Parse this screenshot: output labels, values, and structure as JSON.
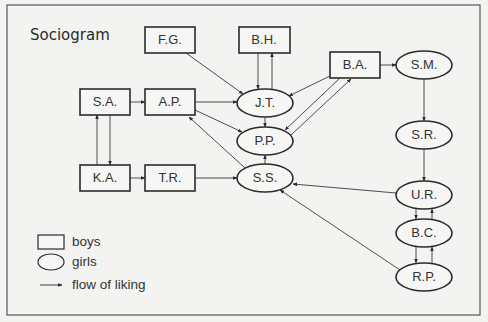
{
  "title": "Sociogram",
  "nodes": [
    {
      "id": "FG",
      "label": "F.G.",
      "type": "boy"
    },
    {
      "id": "BH",
      "label": "B.H.",
      "type": "boy"
    },
    {
      "id": "BA",
      "label": "B.A.",
      "type": "boy"
    },
    {
      "id": "SM",
      "label": "S.M.",
      "type": "girl"
    },
    {
      "id": "SA",
      "label": "S.A.",
      "type": "boy"
    },
    {
      "id": "AP",
      "label": "A.P.",
      "type": "boy"
    },
    {
      "id": "JT",
      "label": "J.T.",
      "type": "girl"
    },
    {
      "id": "PP",
      "label": "P.P.",
      "type": "girl"
    },
    {
      "id": "SR",
      "label": "S.R.",
      "type": "girl"
    },
    {
      "id": "KA",
      "label": "K.A.",
      "type": "boy"
    },
    {
      "id": "TR",
      "label": "T.R.",
      "type": "boy"
    },
    {
      "id": "SS",
      "label": "S.S.",
      "type": "girl"
    },
    {
      "id": "UR",
      "label": "U.R.",
      "type": "girl"
    },
    {
      "id": "BC",
      "label": "B.C.",
      "type": "girl"
    },
    {
      "id": "RP",
      "label": "R.P.",
      "type": "girl"
    }
  ],
  "edges": [
    [
      "FG",
      "JT"
    ],
    [
      "BH",
      "JT"
    ],
    [
      "JT",
      "BH"
    ],
    [
      "BA",
      "JT"
    ],
    [
      "BA",
      "PP"
    ],
    [
      "PP",
      "BA"
    ],
    [
      "BA",
      "SM"
    ],
    [
      "SM",
      "SR"
    ],
    [
      "SR",
      "UR"
    ],
    [
      "SA",
      "AP"
    ],
    [
      "AP",
      "JT"
    ],
    [
      "AP",
      "PP"
    ],
    [
      "SA",
      "KA"
    ],
    [
      "KA",
      "SA"
    ],
    [
      "KA",
      "TR"
    ],
    [
      "TR",
      "SS"
    ],
    [
      "SS",
      "AP"
    ],
    [
      "SS",
      "PP"
    ],
    [
      "JT",
      "PP"
    ],
    [
      "UR",
      "SS"
    ],
    [
      "RP",
      "SS"
    ],
    [
      "UR",
      "BC"
    ],
    [
      "BC",
      "UR"
    ],
    [
      "BC",
      "RP"
    ],
    [
      "RP",
      "BC"
    ]
  ],
  "legend": {
    "boys": "boys",
    "girls": "girls",
    "flow": "flow of liking"
  }
}
